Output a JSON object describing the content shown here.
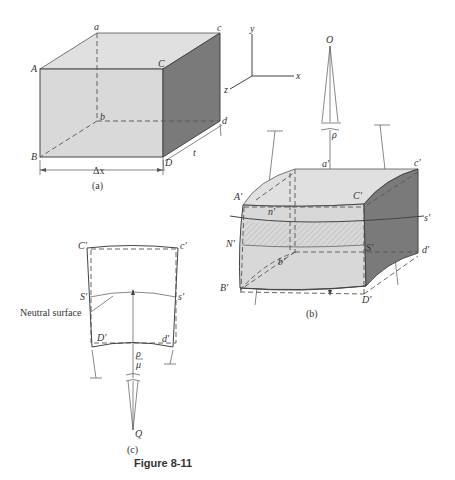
{
  "figure": {
    "title": "Figure 8-11",
    "colors": {
      "face_light": "#d9d9d9",
      "face_top": "#e2e2e2",
      "face_dark": "#7a7a7a",
      "hatch": "#bbbbbb",
      "line": "#444444"
    }
  },
  "panel_a": {
    "caption": "(a)",
    "vertices": {
      "a": "a",
      "c": "c",
      "A": "A",
      "C": "C",
      "b": "b",
      "d": "d",
      "B": "B",
      "D": "D"
    },
    "dim_width": "Δx",
    "dim_depth": "t"
  },
  "axes": {
    "x": "x",
    "y": "y",
    "z": "z"
  },
  "panel_b": {
    "caption": "(b)",
    "center": "O",
    "radius": "ρ",
    "vertices": {
      "a": "a′",
      "c": "c′",
      "A": "A′",
      "C": "C′",
      "n": "n′",
      "s": "s′",
      "N": "N′",
      "S": "S′",
      "b": "b′",
      "d": "d′",
      "B": "B′",
      "D": "D′"
    }
  },
  "panel_c": {
    "caption": "(c)",
    "center": "Q",
    "radius_top": "ρ",
    "radius_bottom": "μ",
    "annotation": "Neutral surface",
    "vertices": {
      "C": "C′",
      "c": "c′",
      "S": "S′",
      "s": "s′",
      "D": "D′",
      "d": "d′"
    }
  }
}
